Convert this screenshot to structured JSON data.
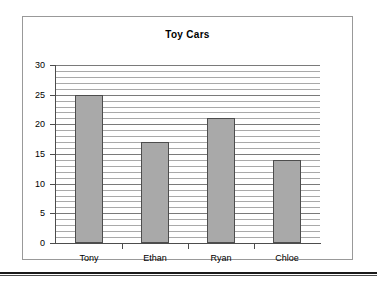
{
  "chart_data": {
    "type": "bar",
    "title": "Toy Cars",
    "categories": [
      "Tony",
      "Ethan",
      "Ryan",
      "Chloe"
    ],
    "values": [
      25,
      17,
      21,
      14
    ],
    "xlabel": "",
    "ylabel": "",
    "ylim": [
      0,
      30
    ],
    "y_ticks": [
      30,
      25,
      20,
      15,
      10,
      5,
      0
    ],
    "y_tick_labels": [
      "30",
      "25",
      "20",
      "15",
      "10",
      "5",
      "0"
    ],
    "y_major_interval": 5,
    "y_minor_interval": 1,
    "grid": "horizontal-major-and-minor",
    "legend": "none",
    "series": [
      {
        "name": "Toy Cars",
        "values": [
          25,
          17,
          21,
          14
        ]
      }
    ],
    "bar_fill_color": "#a9a9a9",
    "bar_border_color": "#4d4d4d",
    "gridline_color": "#a9a9a9",
    "axis_color": "#4d4d4d",
    "plot_background": "#ffffff",
    "frame_border_color": "#999999"
  }
}
